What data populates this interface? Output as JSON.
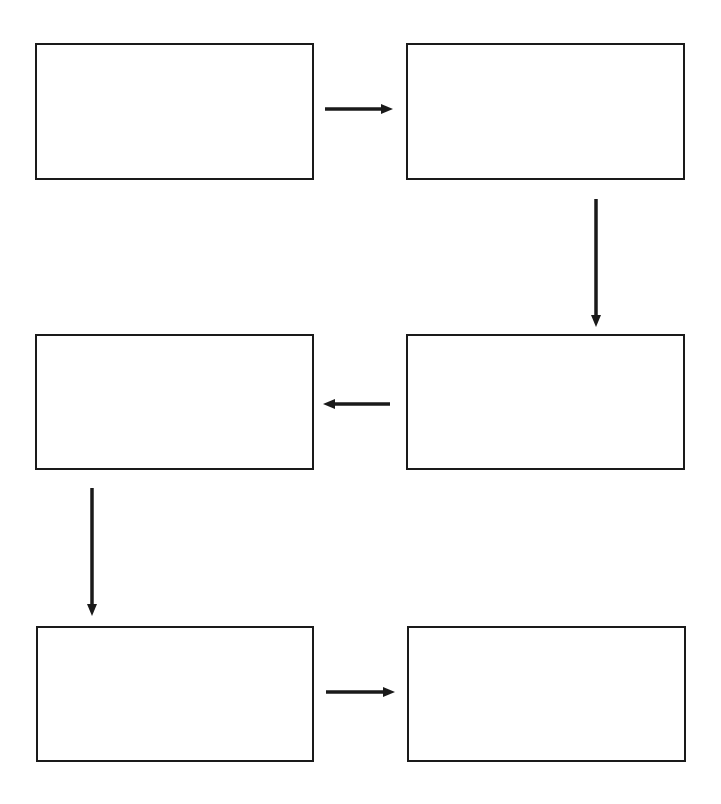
{
  "diagram": {
    "type": "sequence-flow-chart",
    "stroke_color": "#1a1a1a",
    "background": "#ffffff",
    "boxes": [
      {
        "id": "step-1",
        "text": "",
        "x": 35,
        "y": 43,
        "w": 279,
        "h": 137
      },
      {
        "id": "step-2",
        "text": "",
        "x": 406,
        "y": 43,
        "w": 279,
        "h": 137
      },
      {
        "id": "step-3",
        "text": "",
        "x": 406,
        "y": 334,
        "w": 279,
        "h": 136
      },
      {
        "id": "step-4",
        "text": "",
        "x": 35,
        "y": 334,
        "w": 279,
        "h": 136
      },
      {
        "id": "step-5",
        "text": "",
        "x": 36,
        "y": 626,
        "w": 278,
        "h": 136
      },
      {
        "id": "step-6",
        "text": "",
        "x": 407,
        "y": 626,
        "w": 279,
        "h": 136
      }
    ],
    "arrows": [
      {
        "id": "arrow-1-to-2",
        "direction": "right",
        "x1": 325,
        "y1": 109,
        "x2": 393,
        "y2": 109
      },
      {
        "id": "arrow-2-to-3",
        "direction": "down",
        "x1": 596,
        "y1": 199,
        "x2": 596,
        "y2": 327
      },
      {
        "id": "arrow-3-to-4",
        "direction": "left",
        "x1": 390,
        "y1": 404,
        "x2": 323,
        "y2": 404
      },
      {
        "id": "arrow-4-to-5",
        "direction": "down",
        "x1": 92,
        "y1": 488,
        "x2": 92,
        "y2": 616
      },
      {
        "id": "arrow-5-to-6",
        "direction": "right",
        "x1": 326,
        "y1": 692,
        "x2": 395,
        "y2": 692
      }
    ]
  }
}
